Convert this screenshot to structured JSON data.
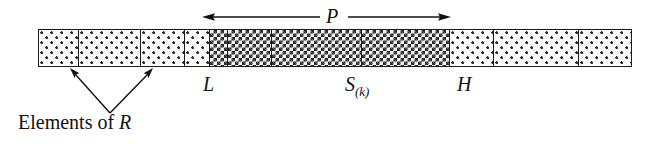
{
  "figure": {
    "type": "array-partition-diagram",
    "background_color": "#ffffff",
    "ink_color": "#111111"
  },
  "array": {
    "name": "array-bar",
    "x": 38,
    "y": 29,
    "width": 594,
    "height": 38,
    "border_color": "#1a1a1a",
    "cells": [
      {
        "id": "cell-1",
        "width": 40,
        "fill": "light",
        "region": "R"
      },
      {
        "id": "cell-2",
        "width": 62,
        "fill": "light",
        "region": "R"
      },
      {
        "id": "cell-3",
        "width": 44,
        "fill": "light",
        "region": "R"
      },
      {
        "id": "cell-4",
        "width": 26,
        "fill": "light",
        "region": "R"
      },
      {
        "id": "cell-5",
        "width": 18,
        "fill": "dark",
        "region": "P"
      },
      {
        "id": "cell-6",
        "width": 44,
        "fill": "dark",
        "region": "P"
      },
      {
        "id": "cell-7",
        "width": 90,
        "fill": "dark",
        "region": "P"
      },
      {
        "id": "cell-8",
        "width": 88,
        "fill": "dark",
        "region": "P"
      },
      {
        "id": "cell-9",
        "width": 45,
        "fill": "light",
        "region": "R"
      },
      {
        "id": "cell-10",
        "width": 85,
        "fill": "light",
        "region": "R"
      },
      {
        "id": "cell-11",
        "width": 52,
        "fill": "light",
        "region": "R"
      }
    ],
    "fills": {
      "light": "sparse-dot-stipple",
      "dark": "dense-checkerboard"
    }
  },
  "span_arrow": {
    "name": "p-span-arrow",
    "label": "P",
    "style": "double-headed",
    "x_start": 203,
    "x_end": 450,
    "y": 17,
    "label_x": 326,
    "gap_left": 320,
    "gap_right": 348
  },
  "labels": {
    "L": "L",
    "S": "S",
    "S_subscript": "(k)",
    "H": "H",
    "P": "P",
    "elements_note_prefix": "Elements of ",
    "elements_note_symbol": "R",
    "elements_note_full": "Elements of R"
  },
  "leader_arrows": {
    "name": "elements-of-r-leaders",
    "apex_x": 110,
    "apex_y": 113,
    "targets": [
      {
        "id": "leader-left",
        "tip_x": 71,
        "tip_y": 70
      },
      {
        "id": "leader-right",
        "tip_x": 152,
        "tip_y": 70
      }
    ]
  }
}
